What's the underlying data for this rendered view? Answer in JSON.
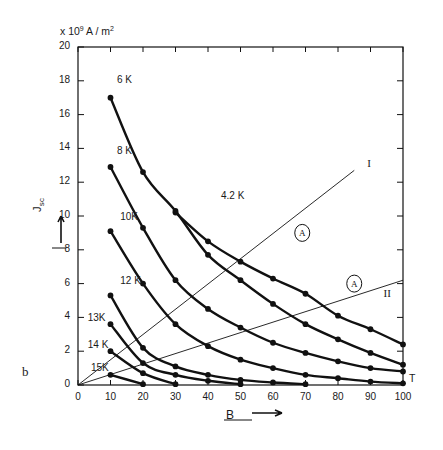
{
  "figure": {
    "panel_label": "b",
    "y_units": "x 10⁹ A / m²",
    "y_axis_label": "J",
    "y_axis_sub": "sc",
    "x_axis_label": "B",
    "x_axis_unit": "T"
  },
  "chart_data": {
    "type": "line",
    "title": "",
    "subtitle": "",
    "xlabel": "B",
    "ylabel": "Jsc",
    "x_unit": "T",
    "y_unit": "x 10^9 A / m^2",
    "xlim": [
      0,
      100
    ],
    "ylim": [
      0,
      20
    ],
    "xticks": [
      0,
      10,
      20,
      30,
      40,
      50,
      60,
      70,
      80,
      90,
      100
    ],
    "yticks": [
      0,
      2,
      4,
      6,
      8,
      10,
      12,
      14,
      16,
      18,
      20
    ],
    "xtick_labels": [
      "0",
      "10",
      "20",
      "30",
      "40",
      "50",
      "60",
      "70",
      "80",
      "90",
      "100"
    ],
    "ytick_labels": [
      "0",
      "2",
      "4",
      "6",
      "8",
      "10",
      "12",
      "14",
      "16",
      "18",
      "20"
    ],
    "grid": false,
    "legend": "inline-labels",
    "series": [
      {
        "name": "4.2 K",
        "label": "4.2 K",
        "label_x": 44,
        "label_y": 11.1,
        "marker": "filled-circle",
        "x": [
          30,
          40,
          50,
          60,
          70,
          80,
          90,
          100
        ],
        "y": [
          10.2,
          8.5,
          7.3,
          6.3,
          5.4,
          4.1,
          3.3,
          2.4
        ]
      },
      {
        "name": "6 K",
        "label": "6 K",
        "label_x": 12,
        "label_y": 18.0,
        "marker": "filled-circle",
        "x": [
          10,
          20,
          30,
          40,
          50,
          60,
          70,
          80,
          90,
          100
        ],
        "y": [
          17.0,
          12.6,
          10.3,
          7.7,
          6.2,
          4.8,
          3.6,
          2.7,
          1.9,
          1.2
        ]
      },
      {
        "name": "8 K",
        "label": "8 K",
        "label_x": 12,
        "label_y": 13.8,
        "marker": "filled-circle",
        "x": [
          10,
          20,
          30,
          40,
          50,
          60,
          70,
          80,
          90,
          100
        ],
        "y": [
          12.9,
          9.3,
          6.2,
          4.5,
          3.4,
          2.5,
          1.9,
          1.4,
          1.0,
          0.8
        ]
      },
      {
        "name": "10 K",
        "label": "10K",
        "label_x": 13,
        "label_y": 9.9,
        "marker": "filled-circle",
        "x": [
          10,
          20,
          30,
          40,
          50,
          60,
          70,
          80,
          90,
          100
        ],
        "y": [
          9.1,
          6.0,
          3.6,
          2.3,
          1.5,
          1.0,
          0.6,
          0.4,
          0.2,
          0.1
        ]
      },
      {
        "name": "12 K",
        "label": "12 K",
        "label_x": 13,
        "label_y": 6.1,
        "marker": "filled-circle",
        "x": [
          10,
          20,
          30,
          40,
          50,
          60,
          70
        ],
        "y": [
          5.3,
          2.2,
          1.1,
          0.6,
          0.3,
          0.15,
          0.05
        ]
      },
      {
        "name": "13 K",
        "label": "13K",
        "label_x": 3,
        "label_y": 3.9,
        "marker": "filled-circle",
        "x": [
          10,
          20,
          30,
          40,
          50
        ],
        "y": [
          3.6,
          1.3,
          0.6,
          0.25,
          0.05
        ]
      },
      {
        "name": "14 K",
        "label": "14 K",
        "label_x": 3,
        "label_y": 2.3,
        "marker": "filled-circle",
        "x": [
          10,
          20,
          30
        ],
        "y": [
          2.0,
          0.7,
          0.05
        ]
      },
      {
        "name": "15 K",
        "label": "15K",
        "label_x": 4,
        "label_y": 0.95,
        "marker": "filled-circle",
        "x": [
          10,
          20
        ],
        "y": [
          0.6,
          0.05
        ]
      }
    ],
    "reference_lines": [
      {
        "name": "I",
        "label": "I",
        "label_x": 89,
        "label_y": 13.0,
        "from": [
          0,
          0
        ],
        "to": [
          85,
          12.7
        ],
        "annotation": "A",
        "annotation_x": 69,
        "annotation_y": 9.0
      },
      {
        "name": "II",
        "label": "II",
        "label_x": 94,
        "label_y": 5.3,
        "from": [
          0,
          0
        ],
        "to": [
          100,
          6.2
        ],
        "annotation": "A",
        "annotation_x": 85,
        "annotation_y": 6.0
      }
    ]
  }
}
